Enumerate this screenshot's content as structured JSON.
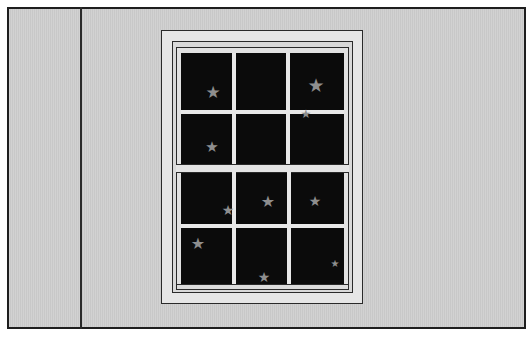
{
  "scene": {
    "description": "Wall with a double-hung window showing a starry night sky",
    "colors": {
      "wall": "#cdcdcd",
      "outline": "#1e1e1e",
      "trim": "#e6e6e6",
      "glass": "#0b0b0b",
      "star": "#8e8e8e"
    }
  },
  "stars": [
    {
      "x": 213,
      "y": 92,
      "size": 17
    },
    {
      "x": 316,
      "y": 85,
      "size": 19
    },
    {
      "x": 306,
      "y": 114,
      "size": 12
    },
    {
      "x": 212,
      "y": 147,
      "size": 15
    },
    {
      "x": 228,
      "y": 210,
      "size": 14
    },
    {
      "x": 268,
      "y": 202,
      "size": 16
    },
    {
      "x": 315,
      "y": 201,
      "size": 14
    },
    {
      "x": 198,
      "y": 244,
      "size": 16
    },
    {
      "x": 264,
      "y": 277,
      "size": 14
    },
    {
      "x": 335,
      "y": 264,
      "size": 10
    }
  ]
}
